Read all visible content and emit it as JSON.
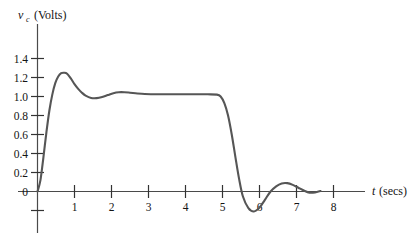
{
  "chart_data": {
    "type": "line",
    "title": "",
    "xlabel": "t (secs)",
    "ylabel": "v_c (Volts)",
    "ylabel_symbol": "v",
    "ylabel_subscript": "c",
    "ylabel_units": "(Volts)",
    "xlabel_symbol": "t",
    "xlabel_units": "(secs)",
    "grid": false,
    "legend": "none",
    "xlim": [
      0,
      8.6
    ],
    "ylim": [
      -0.3,
      1.55
    ],
    "xticks": [
      1,
      2,
      3,
      4,
      5,
      6,
      7,
      8
    ],
    "xtick_labels": [
      "1",
      "2",
      "3",
      "4",
      "5",
      "6",
      "7",
      "8"
    ],
    "yticks": [
      -0.2,
      0,
      0.2,
      0.4,
      0.6,
      0.8,
      1.0,
      1.2,
      1.4
    ],
    "ytick_labels": [
      "",
      "0",
      "0.2",
      "0.4",
      "0.6",
      "0.8",
      "1.0",
      "1.2",
      "1.4"
    ],
    "series": [
      {
        "name": "v_c",
        "color": "#565656",
        "x": [
          0.0,
          0.08,
          0.16,
          0.24,
          0.32,
          0.4,
          0.48,
          0.56,
          0.64,
          0.72,
          0.8,
          0.9,
          1.0,
          1.1,
          1.2,
          1.3,
          1.45,
          1.6,
          1.75,
          1.9,
          2.05,
          2.2,
          2.35,
          2.5,
          2.7,
          2.9,
          3.1,
          3.4,
          3.8,
          4.2,
          4.6,
          4.85,
          4.95,
          5.05,
          5.15,
          5.25,
          5.35,
          5.45,
          5.55,
          5.7,
          5.85,
          6.0,
          6.15,
          6.3,
          6.45,
          6.6,
          6.75,
          6.9,
          7.05,
          7.2,
          7.35,
          7.5,
          7.65
        ],
        "y": [
          0.0,
          0.12,
          0.36,
          0.62,
          0.85,
          1.02,
          1.14,
          1.21,
          1.245,
          1.25,
          1.24,
          1.19,
          1.13,
          1.08,
          1.04,
          1.01,
          0.985,
          0.983,
          0.995,
          1.015,
          1.035,
          1.045,
          1.045,
          1.04,
          1.032,
          1.026,
          1.024,
          1.023,
          1.023,
          1.023,
          1.023,
          1.02,
          1.0,
          0.93,
          0.8,
          0.6,
          0.36,
          0.13,
          -0.05,
          -0.175,
          -0.21,
          -0.17,
          -0.085,
          0.0,
          0.055,
          0.085,
          0.088,
          0.07,
          0.04,
          0.01,
          -0.012,
          -0.01,
          0.005
        ]
      }
    ],
    "annotations": {
      "overshoot_peak": {
        "t": 0.78,
        "v": 1.25
      },
      "first_undershoot": {
        "t": 1.62,
        "v": 0.983
      },
      "second_overshoot": {
        "t": 2.22,
        "v": 1.045
      },
      "plateau_level": {
        "v": 1.023,
        "t_start": 2.9,
        "t_end": 4.9
      },
      "negative_minimum": {
        "t": 5.8,
        "v": -0.21
      },
      "post_bump_peak": {
        "t": 6.7,
        "v": 0.088
      }
    }
  }
}
